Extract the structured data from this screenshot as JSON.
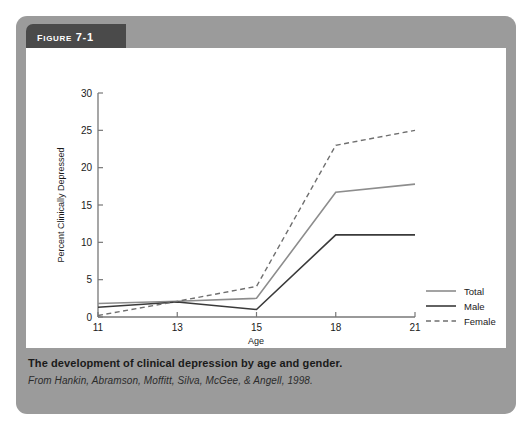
{
  "figure": {
    "header_label": "Figure 7-1",
    "caption_title": "The development of clinical depression by age and gender.",
    "caption_source": "From Hankin, Abramson, Moffitt, Silva, McGee, & Angell, 1998.",
    "panel_color": "#9b9b9b",
    "header_color": "#4a4a4a",
    "plot_bg_color": "#ffffff"
  },
  "chart_data": {
    "type": "line",
    "title": "",
    "xlabel": "Age",
    "ylabel": "Percent Clinically Depressed",
    "categories": [
      "11",
      "13",
      "15",
      "18",
      "21"
    ],
    "x": [
      11,
      13,
      15,
      18,
      21
    ],
    "xtick_labels": [
      "11",
      "13",
      "15",
      "18",
      "21"
    ],
    "ytick_labels": [
      "0",
      "5",
      "10",
      "15",
      "20",
      "25",
      "30"
    ],
    "yticks": [
      0,
      5,
      10,
      15,
      20,
      25,
      30
    ],
    "ylim": [
      0,
      30
    ],
    "grid": false,
    "legend_position": "right",
    "series": [
      {
        "name": "Total",
        "values": [
          1.8,
          2.1,
          2.5,
          16.7,
          17.8
        ],
        "color": "#8d8d8d",
        "style": "solid",
        "width": 1.6
      },
      {
        "name": "Male",
        "values": [
          1.3,
          2.0,
          1.0,
          11.0,
          11.0
        ],
        "color": "#3a3a3a",
        "style": "solid",
        "width": 1.6
      },
      {
        "name": "Female",
        "values": [
          0.2,
          2.1,
          4.1,
          23.0,
          25.0
        ],
        "color": "#6f6f6f",
        "style": "dashed",
        "width": 1.4
      }
    ]
  }
}
